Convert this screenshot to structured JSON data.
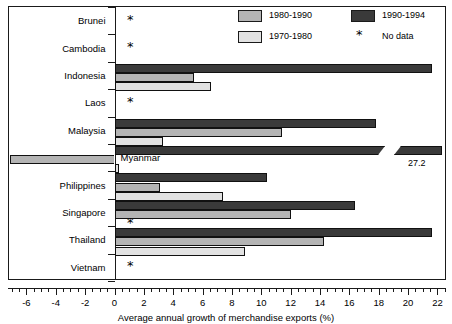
{
  "chart_data": {
    "type": "bar",
    "orientation": "horizontal",
    "title": "",
    "xlabel": "Average annual growth of merchandise exports (%)",
    "ylabel": "",
    "xlim": [
      -7.2,
      22.6
    ],
    "xticks": [
      -6,
      -4,
      -2,
      0,
      2,
      4,
      6,
      8,
      10,
      12,
      14,
      16,
      18,
      20,
      22
    ],
    "xtick_labels": [
      "-6",
      "-4",
      "-2",
      "0",
      "2",
      "4",
      "6",
      "8",
      "10",
      "12",
      "14",
      "16",
      "18",
      "20",
      "22"
    ],
    "grid": false,
    "legend_position": "top-right",
    "no_data_marker": "*",
    "categories": [
      "Brunei",
      "Cambodia",
      "Indonesia",
      "Laos",
      "Malaysia",
      "Myanmar",
      "Philippines",
      "Singapore",
      "Thailand",
      "Vietnam"
    ],
    "series": [
      {
        "name": "1990-1994",
        "color": "#3a3a3a",
        "values": [
          null,
          null,
          21.6,
          null,
          17.8,
          27.2,
          10.4,
          16.4,
          21.6,
          null
        ]
      },
      {
        "name": "1980-1990",
        "color": "#b4b4b4",
        "values": [
          null,
          null,
          5.4,
          null,
          11.4,
          -7.1,
          3.1,
          12.0,
          14.3,
          null
        ]
      },
      {
        "name": "1970-1980",
        "color": "#e2e2e2",
        "values": [
          null,
          null,
          6.6,
          null,
          3.3,
          0.3,
          7.4,
          null,
          8.9,
          null
        ]
      }
    ],
    "annotations": [
      {
        "text": "27.2",
        "series": "1990-1994",
        "category": "Myanmar",
        "note": "value label for axis-broken bar"
      }
    ],
    "no_data_categories": [
      "Brunei",
      "Cambodia",
      "Laos",
      "Vietnam"
    ],
    "no_data_series_points": [
      {
        "category": "Singapore",
        "series": "1970-1980"
      }
    ]
  },
  "legend": {
    "items": [
      {
        "label": "1980-1990",
        "swatch_color": "#b4b4b4",
        "kind": "swatch"
      },
      {
        "label": "1990-1994",
        "swatch_color": "#3a3a3a",
        "kind": "swatch"
      },
      {
        "label": "1970-1980",
        "swatch_color": "#e2e2e2",
        "kind": "swatch"
      },
      {
        "label": "No data",
        "swatch_color": "#000000",
        "kind": "asterisk",
        "glyph": "*"
      }
    ]
  },
  "axis": {
    "x_title": "Average annual growth of merchandise exports (%)",
    "tick_labels": [
      "-6",
      "-4",
      "-2",
      "0",
      "2",
      "4",
      "6",
      "8",
      "10",
      "12",
      "14",
      "16",
      "18",
      "20",
      "22"
    ]
  },
  "category_labels": [
    "Brunei",
    "Cambodia",
    "Indonesia",
    "Laos",
    "Malaysia",
    "Myanmar",
    "Philippines",
    "Singapore",
    "Thailand",
    "Vietnam"
  ],
  "value_labels": {
    "myanmar_1990_1994": "27.2"
  },
  "markers": {
    "no_data": "*"
  },
  "colors": {
    "series_1990_1994": "#3a3a3a",
    "series_1980_1990": "#b4b4b4",
    "series_1970_1980": "#e2e2e2",
    "axis": "#1a1a1a",
    "background": "#ffffff"
  }
}
